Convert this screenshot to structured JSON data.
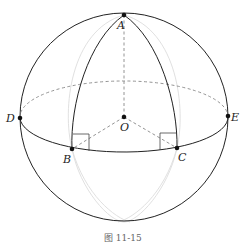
{
  "figure": {
    "caption": "图 11-15",
    "colors": {
      "main_stroke": "#222222",
      "hidden_stroke": "#888888",
      "faint_stroke": "#d8d8d8",
      "background": "#ffffff"
    }
  },
  "points": {
    "A": {
      "label": "A",
      "x": 124,
      "y": 15
    },
    "O": {
      "label": "O",
      "x": 124,
      "y": 117
    },
    "D": {
      "label": "D",
      "x": 20,
      "y": 118
    },
    "E": {
      "label": "E",
      "x": 228,
      "y": 116
    },
    "B": {
      "label": "B",
      "x": 72,
      "y": 149
    },
    "C": {
      "label": "C",
      "x": 177,
      "y": 148
    }
  },
  "sphere": {
    "cx": 124,
    "cy": 117,
    "r": 104
  }
}
